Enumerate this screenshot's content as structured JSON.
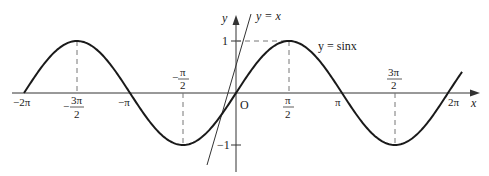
{
  "chart_data": {
    "type": "line",
    "title": "",
    "xlabel": "x",
    "ylabel": "y",
    "origin_label": "O",
    "xlim": [
      -6.2832,
      6.7
    ],
    "ylim": [
      -1.4,
      1.6
    ],
    "grid": false,
    "legend": "none",
    "series": [
      {
        "name": "y = sinx",
        "label": "y = sinx",
        "function": "sin(x)",
        "x": [
          -6.2832,
          -4.7124,
          -3.1416,
          -1.5708,
          0,
          1.5708,
          3.1416,
          4.7124,
          6.2832
        ],
        "y": [
          0,
          1,
          0,
          -1,
          0,
          1,
          0,
          -1,
          0
        ],
        "color": "#1a1a1a"
      },
      {
        "name": "y = x",
        "label": "y = x",
        "function": "x",
        "x": [
          -1.4,
          1.4
        ],
        "y": [
          -1.4,
          1.4
        ],
        "color": "#333333"
      }
    ],
    "x_ticks": [
      {
        "value": -6.2832,
        "label": "−2π"
      },
      {
        "value": -4.7124,
        "label_num": "3π",
        "label_den": "2",
        "sign": "−"
      },
      {
        "value": -3.1416,
        "label": "−π"
      },
      {
        "value": -1.5708,
        "label_num": "π",
        "label_den": "2",
        "sign": "−"
      },
      {
        "value": 1.5708,
        "label_num": "π",
        "label_den": "2",
        "sign": ""
      },
      {
        "value": 3.1416,
        "label": "π"
      },
      {
        "value": 4.7124,
        "label_num": "3π",
        "label_den": "2",
        "sign": ""
      },
      {
        "value": 6.2832,
        "label": "2π"
      }
    ],
    "y_ticks": [
      {
        "value": 1,
        "label": "1"
      },
      {
        "value": -1,
        "label": "−1"
      }
    ],
    "annotations": [
      "dashed guide lines from extrema to x-axis",
      "dashed line from y=1 to peak at π/2"
    ]
  },
  "labels": {
    "y_axis": "y",
    "x_axis": "x",
    "origin": "O",
    "sin_label": "y = sinx",
    "line_label": "y = x",
    "y_one": "1",
    "y_neg_one": "−1",
    "neg_two_pi": "−2π",
    "neg_pi": "−π",
    "pi": "π",
    "two_pi": "2π",
    "neg_three_pi_half_sign": "−",
    "neg_three_pi_half_num": "3π",
    "neg_three_pi_half_den": "2",
    "neg_pi_half_sign": "−",
    "neg_pi_half_num": "π",
    "neg_pi_half_den": "2",
    "pi_half_num": "π",
    "pi_half_den": "2",
    "three_pi_half_num": "3π",
    "three_pi_half_den": "2"
  }
}
